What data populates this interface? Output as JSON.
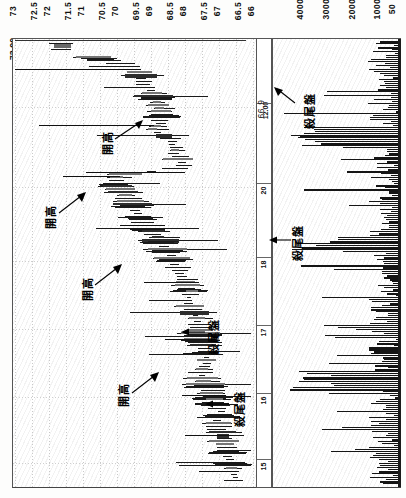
{
  "chart_data": {
    "type": "bar",
    "title": "",
    "subtitle": "",
    "orientation": "rotated-90",
    "price_axis": {
      "label": "",
      "ticks": [
        "73",
        "72.5",
        "72",
        "71.5",
        "71",
        "70.5",
        "70",
        "69.5",
        "69",
        "68.5",
        "68",
        "67.5",
        "67",
        "66.5",
        "66"
      ],
      "range": [
        66,
        73
      ],
      "open_marker": "73.00",
      "mid_marker": "66.9"
    },
    "time_axis": {
      "label": "",
      "ticks": [
        "12.00",
        "20",
        "18",
        "17",
        "16",
        "15"
      ],
      "grid": true
    },
    "volume_axis": {
      "label": "",
      "ticks": [
        "4000",
        "3000",
        "2000",
        "1000",
        "50"
      ],
      "range": [
        50,
        4500
      ]
    },
    "annotations": [
      {
        "text": "開高",
        "panel": "price",
        "id": "kaigao-1"
      },
      {
        "text": "開高",
        "panel": "price",
        "id": "kaigao-2"
      },
      {
        "text": "開高",
        "panel": "price",
        "id": "kaigao-3"
      },
      {
        "text": "開高",
        "panel": "price",
        "id": "kaigao-4"
      },
      {
        "text": "殺尾盤",
        "panel": "price",
        "id": "shaweipan-1"
      },
      {
        "text": "殺尾盤",
        "panel": "price",
        "id": "shaweipan-2"
      },
      {
        "text": "殺尾盤",
        "panel": "volume",
        "id": "shaweipan-3"
      },
      {
        "text": "殺尾盤",
        "panel": "volume",
        "id": "shaweipan-4"
      }
    ],
    "legend": [],
    "series": [
      {
        "name": "price-bars",
        "note": "OHLC horizontal bars, price on rotated vertical axis",
        "values": [
          73.0,
          71.6,
          71.5,
          70.3,
          70.1,
          69.9,
          69.6,
          69.5,
          69.4,
          69.2,
          69.0,
          68.9,
          68.8,
          68.6,
          68.5,
          68.4,
          68.2,
          68.0,
          67.9,
          67.8,
          67.6,
          67.4,
          67.3,
          67.2,
          67.0,
          66.9,
          66.8,
          66.7,
          66.6,
          66.5
        ]
      },
      {
        "name": "volume-bars",
        "note": "trade volume per interval",
        "values": [
          120,
          300,
          460,
          1800,
          900,
          540,
          2400,
          700,
          380,
          260,
          1500,
          640,
          420,
          3100,
          980,
          560,
          300,
          2200,
          760,
          440,
          1900,
          880,
          520,
          340,
          2600,
          1100,
          600,
          380,
          1400,
          700
        ]
      }
    ]
  },
  "axis": {
    "price_top_label": "73.00",
    "price_mid_label": "66.9",
    "time_top_label": "12.00"
  }
}
